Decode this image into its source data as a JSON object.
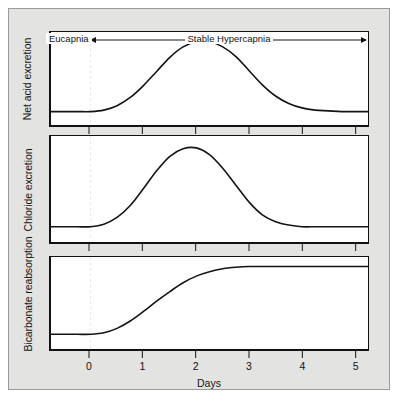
{
  "figure": {
    "background_color": "#e3e3e1",
    "panel_background": "#ffffff",
    "line_color": "#141414",
    "dashed_line_color": "#d2d2cf"
  },
  "axis": {
    "xlabel": "Days",
    "ticks": [
      "0",
      "1",
      "2",
      "3",
      "4",
      "5"
    ],
    "tick_values": [
      0,
      1,
      2,
      3,
      4,
      5
    ],
    "xmin": -0.75,
    "xmax": 5.25
  },
  "annotations": [
    {
      "label": "Eucapnia",
      "from": -0.75,
      "to": 0
    },
    {
      "label": "Stable Hypercapnia",
      "from": 0,
      "to": 5.25
    }
  ],
  "panels": [
    {
      "ylabel": "Net acid excretion"
    },
    {
      "ylabel": "Chloride excretion"
    },
    {
      "ylabel": "Bicarbonate reabsorption"
    }
  ],
  "chart_data": {
    "type": "line",
    "title": "",
    "xlabel": "Days",
    "ylabel": "",
    "xlim": [
      -0.75,
      5.25
    ],
    "grid": false,
    "legend": "none",
    "x": [
      -0.75,
      -0.5,
      -0.25,
      0,
      0.25,
      0.5,
      0.75,
      1,
      1.25,
      1.5,
      1.75,
      2,
      2.25,
      2.5,
      2.75,
      3,
      3.25,
      3.5,
      3.75,
      4,
      4.25,
      4.5,
      4.75,
      5,
      5.25
    ],
    "series": [
      {
        "name": "Net acid excretion",
        "values": [
          0.03,
          0.03,
          0.03,
          0.03,
          0.05,
          0.11,
          0.22,
          0.38,
          0.57,
          0.76,
          0.9,
          0.97,
          0.97,
          0.9,
          0.77,
          0.58,
          0.39,
          0.24,
          0.14,
          0.08,
          0.05,
          0.04,
          0.03,
          0.03,
          0.03
        ],
        "shape": "bell",
        "peak_day": 2.0,
        "baseline_return_day": 4.3
      },
      {
        "name": "Chloride excretion",
        "values": [
          0.03,
          0.03,
          0.03,
          0.03,
          0.06,
          0.14,
          0.28,
          0.48,
          0.69,
          0.86,
          0.95,
          0.96,
          0.88,
          0.72,
          0.52,
          0.32,
          0.17,
          0.09,
          0.05,
          0.03,
          0.03,
          0.03,
          0.03,
          0.03,
          0.03
        ],
        "shape": "bell",
        "peak_day": 1.75,
        "baseline_return_day": 3.4
      },
      {
        "name": "Bicarbonate reabsorption",
        "values": [
          0.05,
          0.05,
          0.05,
          0.05,
          0.07,
          0.13,
          0.23,
          0.36,
          0.5,
          0.63,
          0.75,
          0.84,
          0.9,
          0.94,
          0.96,
          0.97,
          0.97,
          0.97,
          0.97,
          0.97,
          0.97,
          0.97,
          0.97,
          0.97,
          0.97
        ],
        "shape": "sigmoid",
        "plateau_day": 2.9,
        "plateau_value": 0.97
      }
    ]
  }
}
